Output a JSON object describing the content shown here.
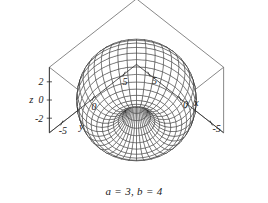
{
  "figure": {
    "kind": "3d-surface-plot",
    "caption": "a = 3, b = 4",
    "background_color": "#ffffff",
    "mesh_color": "#1a1a1a",
    "axis_color": "#2b2b2b",
    "box_color": "#555555"
  },
  "chart_data": {
    "type": "line",
    "title": "",
    "subtitle": "",
    "plot_kind": "3d-parametric-surface-wireframe",
    "surface": "torus",
    "equations": {
      "x": "(b + a cos(v)) cos(u)",
      "y": "(b + a cos(v)) sin(u)",
      "z": "a sin(v)"
    },
    "parameters": {
      "a": 3,
      "b": 4
    },
    "parameter_ranges": {
      "u": [
        0,
        6.283185307179586
      ],
      "v": [
        0,
        6.283185307179586
      ]
    },
    "mesh_resolution": {
      "u_lines": 40,
      "v_lines": 28
    },
    "grid": false,
    "legend": false,
    "legend_position": "none",
    "axes": [
      {
        "name": "x",
        "label": "x",
        "ticks": [
          -5,
          0,
          5
        ],
        "tick_labels": [
          "-5",
          "0",
          "5"
        ],
        "range": [
          -7,
          7
        ]
      },
      {
        "name": "y",
        "label": "y",
        "ticks": [
          -5,
          0,
          5
        ],
        "tick_labels": [
          "-5",
          "0",
          "5"
        ],
        "range": [
          -7,
          7
        ]
      },
      {
        "name": "z",
        "label": "z",
        "ticks": [
          2,
          0,
          -2
        ],
        "tick_labels": [
          "2",
          "0",
          "-2"
        ],
        "range": [
          -3.5,
          3.5
        ]
      }
    ],
    "annotations": [
      "a = 3, b = 4"
    ],
    "xlabel": "x",
    "ylabel": "y",
    "zlabel": "z"
  },
  "labels": {
    "z_axis_name": "z",
    "z_ticks": [
      "2",
      "0",
      "-2"
    ],
    "y_axis_name": "y",
    "y_ticks": [
      "-5",
      "0",
      "5"
    ],
    "x_axis_name": "x",
    "x_ticks": [
      "5",
      "0",
      "-5"
    ]
  }
}
